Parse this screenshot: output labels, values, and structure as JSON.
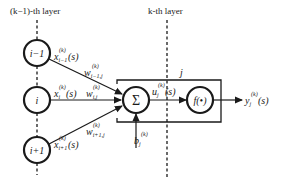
{
  "layers": {
    "prev": {
      "label": "(k−1)-th layer"
    },
    "curr": {
      "label": "k-th layer"
    }
  },
  "nodes": [
    {
      "id": "i-1",
      "label": "i−1",
      "input_label": "x",
      "input_sub": "i−1",
      "input_sup": "(k)",
      "input_arg": "(s)",
      "weight_label": "w",
      "weight_sub": "i−1,j",
      "weight_sup": "(k)"
    },
    {
      "id": "i",
      "label": "i",
      "input_label": "x",
      "input_sub": "i",
      "input_sup": "(k)",
      "input_arg": "(s)",
      "weight_label": "w",
      "weight_sub": "i,j",
      "weight_sup": "(k)"
    },
    {
      "id": "i+1",
      "label": "i+1",
      "input_label": "x",
      "input_sub": "i+1",
      "input_sup": "(k)",
      "input_arg": "(s)",
      "weight_label": "w",
      "weight_sub": "i+1,j",
      "weight_sup": "(k)"
    }
  ],
  "neuron": {
    "index_label": "j",
    "sum_symbol": "Σ",
    "activation": "f(•)",
    "u_label": "u",
    "u_sub": "j",
    "u_sup": "(k)",
    "u_arg": "(s)",
    "bias_label": "b",
    "bias_sub": "j",
    "bias_sup": "(k)",
    "output_label": "y",
    "output_sub": "j",
    "output_sup": "(k)",
    "output_arg": "(s)"
  },
  "colors": {
    "stroke": "#1a1a1a",
    "background": "#ffffff"
  }
}
